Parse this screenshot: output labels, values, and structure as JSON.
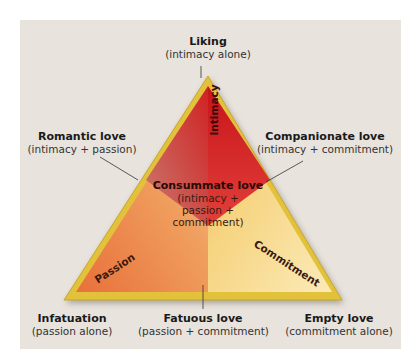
{
  "diagram": {
    "vertices": {
      "top": {
        "name": "Liking",
        "components": "(intimacy alone)"
      },
      "bottom_left": {
        "name": "Infatuation",
        "components": "(passion alone)"
      },
      "bottom_right": {
        "name": "Empty love",
        "components": "(commitment alone)"
      }
    },
    "edges": {
      "left": {
        "name": "Romantic love",
        "components": "(intimacy + passion)"
      },
      "right": {
        "name": "Companionate love",
        "components": "(intimacy + commitment)"
      },
      "bottom": {
        "name": "Fatuous love",
        "components": "(passion + commitment)"
      }
    },
    "center": {
      "name": "Consummate love",
      "line1": "(intimacy +",
      "line2": "passion +",
      "line3": "commitment)"
    },
    "axes": {
      "intimacy": "Intimacy",
      "passion": "Passion",
      "commitment": "Commitment"
    },
    "colors": {
      "background": "#e8e3dc",
      "border": "#e2c13a",
      "intimacy": "#d8201e",
      "passion": "#ee8a45",
      "commitment": "#f6dc86"
    }
  }
}
